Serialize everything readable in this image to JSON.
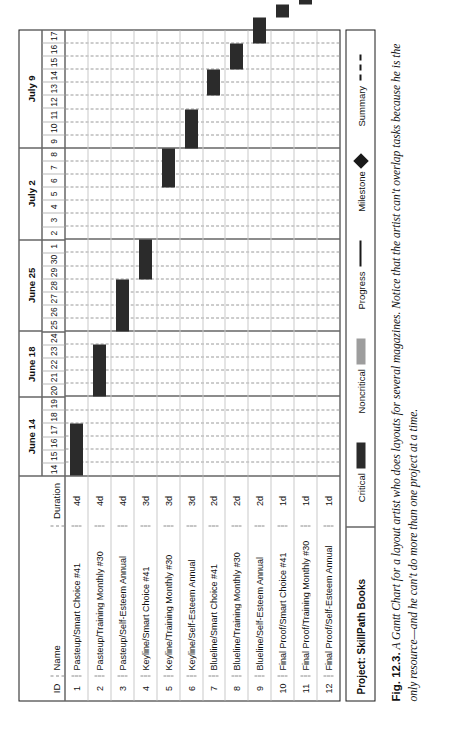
{
  "figure": {
    "label": "Fig. 12.3.",
    "caption": " A Gantt Chart for a layout artist who does layouts for several magazines. Notice that the artist can't overlap tasks because he is the only resource—and he can't do more than one project at a time."
  },
  "table": {
    "headers": {
      "id": "ID",
      "name": "Name",
      "duration": "Duration"
    },
    "rows": [
      {
        "id": "1",
        "name": "Pasteup/Smart Choice #41",
        "duration": "4d",
        "start_day": 14,
        "length_days": 4
      },
      {
        "id": "2",
        "name": "Pasteup/Training Monthly #30",
        "duration": "4d",
        "start_day": 20,
        "length_days": 4
      },
      {
        "id": "3",
        "name": "Pasteup/Self-Esteem Annual",
        "duration": "4d",
        "start_day": 25,
        "length_days": 4
      },
      {
        "id": "4",
        "name": "Keyline/Smart Choice #41",
        "duration": "3d",
        "start_day": 29,
        "length_days": 3
      },
      {
        "id": "5",
        "name": "Keyline/Training Monthly #30",
        "duration": "3d",
        "start_day": 36,
        "length_days": 3
      },
      {
        "id": "6",
        "name": "Keyline/Self-Esteem Annual",
        "duration": "3d",
        "start_day": 39,
        "length_days": 3
      },
      {
        "id": "7",
        "name": "Blueline/Smart Choice #41",
        "duration": "2d",
        "start_day": 43,
        "length_days": 2
      },
      {
        "id": "8",
        "name": "Blueline/Training Monthly #30",
        "duration": "2d",
        "start_day": 45,
        "length_days": 2
      },
      {
        "id": "9",
        "name": "Blueline/Self-Esteem Annual",
        "duration": "2d",
        "start_day": 47,
        "length_days": 2
      },
      {
        "id": "10",
        "name": "Final Proof/Smart Choice #41",
        "duration": "1d",
        "start_day": 49,
        "length_days": 1
      },
      {
        "id": "11",
        "name": "Final Proof/Training Monthly #30",
        "duration": "1d",
        "start_day": 50,
        "length_days": 1
      },
      {
        "id": "12",
        "name": "Final Proof/Self-Esteem Annual",
        "duration": "1d",
        "start_day": 51,
        "length_days": 1
      }
    ]
  },
  "timeline": {
    "weeks": [
      {
        "label": "June 14",
        "days": [
          "14",
          "15",
          "16",
          "17",
          "18",
          "19"
        ]
      },
      {
        "label": "June 18",
        "days": [
          "20",
          "21",
          "22",
          "23",
          "24"
        ]
      },
      {
        "label": "June 25",
        "days": [
          "25",
          "26",
          "27",
          "28",
          "29",
          "30",
          "1"
        ]
      },
      {
        "label": "July 2",
        "days": [
          "2",
          "3",
          "4",
          "5",
          "6",
          "7",
          "8"
        ]
      },
      {
        "label": "July 9",
        "days": [
          "9",
          "10",
          "11",
          "12",
          "13",
          "14",
          "15",
          "16",
          "17"
        ]
      }
    ]
  },
  "footer": {
    "project": "Project: SkillPath Books",
    "legend": [
      {
        "label": "Critical",
        "swatch": "critical-swatch"
      },
      {
        "label": "Noncritical",
        "swatch": "noncritical-swatch"
      },
      {
        "label": "Progress",
        "swatch": "progress-swatch"
      },
      {
        "label": "Milestone",
        "swatch": "milestone-swatch"
      },
      {
        "label": "Summary",
        "swatch": "summary-swatch"
      }
    ]
  },
  "chart_data": {
    "type": "bar",
    "xlabel": "Date (June 14 – July 17)",
    "ylabel": "Task",
    "categories": [
      "Pasteup/Smart Choice #41",
      "Pasteup/Training Monthly #30",
      "Pasteup/Self-Esteem Annual",
      "Keyline/Smart Choice #41",
      "Keyline/Training Monthly #30",
      "Keyline/Self-Esteem Annual",
      "Blueline/Smart Choice #41",
      "Blueline/Training Monthly #30",
      "Blueline/Self-Esteem Annual",
      "Final Proof/Smart Choice #41",
      "Final Proof/Training Monthly #30",
      "Final Proof/Self-Esteem Annual"
    ],
    "values": [
      4,
      4,
      4,
      3,
      3,
      3,
      2,
      2,
      2,
      1,
      1,
      1
    ],
    "series": [
      {
        "name": "Duration (days)",
        "values": [
          4,
          4,
          4,
          3,
          3,
          3,
          2,
          2,
          2,
          1,
          1,
          1
        ]
      },
      {
        "name": "Start (June 14 = day 1)",
        "values": [
          1,
          7,
          12,
          16,
          23,
          26,
          30,
          32,
          34,
          36,
          37,
          38
        ]
      }
    ],
    "bars": [
      {
        "task": "Pasteup/Smart Choice #41",
        "start": "June 14",
        "end": "June 19",
        "days": 4
      },
      {
        "task": "Pasteup/Training Monthly #30",
        "start": "June 20",
        "end": "June 23",
        "days": 4
      },
      {
        "task": "Pasteup/Self-Esteem Annual",
        "start": "June 25",
        "end": "June 28",
        "days": 4
      },
      {
        "task": "Keyline/Smart Choice #41",
        "start": "June 29",
        "end": "July 2",
        "days": 3
      },
      {
        "task": "Keyline/Training Monthly #30",
        "start": "July 3",
        "end": "July 5",
        "days": 3
      },
      {
        "task": "Keyline/Self-Esteem Annual",
        "start": "July 6",
        "end": "July 8",
        "days": 3
      },
      {
        "task": "Blueline/Smart Choice #41",
        "start": "July 10",
        "end": "July 11",
        "days": 2
      },
      {
        "task": "Blueline/Training Monthly #30",
        "start": "July 12",
        "end": "July 13",
        "days": 2
      },
      {
        "task": "Blueline/Self-Esteem Annual",
        "start": "July 13",
        "end": "July 14",
        "days": 2
      },
      {
        "task": "Final Proof/Smart Choice #41",
        "start": "July 15",
        "end": "July 15",
        "days": 1
      },
      {
        "task": "Final Proof/Training Monthly #30",
        "start": "July 16",
        "end": "July 16",
        "days": 1
      },
      {
        "task": "Final Proof/Self-Esteem Annual",
        "start": "July 17",
        "end": "July 17",
        "days": 1
      }
    ],
    "legend": [
      "Critical",
      "Noncritical",
      "Progress",
      "Milestone",
      "Summary"
    ],
    "legend_position": "bottom",
    "grid": true,
    "xlim": [
      "June 14",
      "July 17"
    ]
  }
}
